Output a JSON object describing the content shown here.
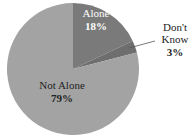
{
  "chart_data": {
    "type": "pie",
    "title": "",
    "slices": [
      {
        "label": "Alone",
        "value": 18,
        "display": "18%",
        "color": "#7a7a7a"
      },
      {
        "label": "Don't Know",
        "value": 3,
        "display": "3%",
        "color": "#6e6e6e"
      },
      {
        "label": "Not Alone",
        "value": 79,
        "display": "79%",
        "color": "#a3a3a3"
      }
    ],
    "start_angle_deg": 0,
    "direction": "clockwise"
  },
  "labels": {
    "alone": {
      "name": "Alone",
      "pct": "18%"
    },
    "dontknow": {
      "name1": "Don't",
      "name2": "Know",
      "pct": "3%"
    },
    "notalone": {
      "name": "Not Alone",
      "pct": "79%"
    }
  }
}
